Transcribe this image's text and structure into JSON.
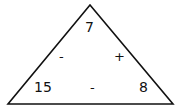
{
  "triangle": {
    "top": "7",
    "bottom_left": "15",
    "bottom_right": "8",
    "left_edge_op": "-",
    "right_edge_op": "+",
    "bottom_edge_op": "-"
  }
}
